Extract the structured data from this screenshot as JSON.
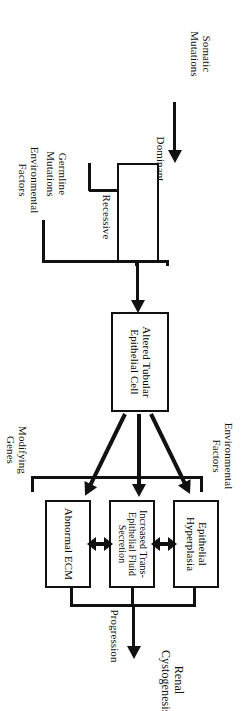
{
  "figure": {
    "orientation": "landscape diagram rotated 90 degrees in the page",
    "ink_color": "#111111",
    "background_color": "#ffffff"
  },
  "inputs": {
    "somatic_mutations": "Somatic\nMutations",
    "germline_mutations": "Germline\nMutations",
    "environmental_factors_bottom": "Environmental\nFactors"
  },
  "mutation_box": {
    "dominant_label": "Dominant",
    "recessive_label": "Recessive"
  },
  "cell_node": {
    "label": "Altered Tubular\nEpithelial Cell"
  },
  "effectors": [
    {
      "id": "epithelial-hyperplasia",
      "label": "Epithelial\nHyperplasia"
    },
    {
      "id": "increased-fluid-secretion",
      "label": "Increased\nTrans-Epithelial\nFluid Secretion"
    },
    {
      "id": "abnormal-ecm",
      "label": "Abnormal\nECM"
    }
  ],
  "modifiers": {
    "environmental_factors_top": "Environmental\nFactors",
    "modifying_genes": "Modifying\nGenes"
  },
  "progression": {
    "arrow_label": "Progression",
    "outcome": "Renal\nCystogenesis"
  }
}
